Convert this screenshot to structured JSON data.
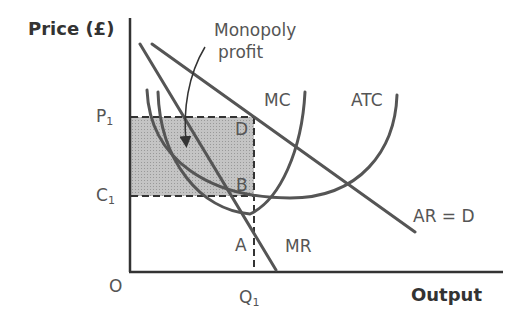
{
  "axes": {
    "y_label": "Price (£)",
    "x_label": "Output",
    "origin": "O"
  },
  "ticks": {
    "p1": {
      "base": "P",
      "sub": "1"
    },
    "c1": {
      "base": "C",
      "sub": "1"
    },
    "q1": {
      "base": "Q",
      "sub": "1"
    }
  },
  "curves": {
    "mc": "MC",
    "atc": "ATC",
    "ar": "AR = D",
    "mr": "MR"
  },
  "points": {
    "a": "A",
    "b": "B",
    "d": "D"
  },
  "annotation": {
    "line1": "Monopoly",
    "line2": "profit"
  },
  "colors": {
    "curve": "#555555",
    "axis": "#333333",
    "shade": "#b8b8b8"
  }
}
